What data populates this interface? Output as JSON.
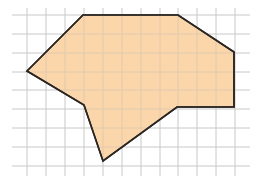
{
  "diagram": {
    "type": "polygon-on-grid",
    "grid": {
      "x_start": 12,
      "x_end": 250,
      "y_start": 8,
      "y_end": 176,
      "vertical_lines": [
        27,
        46,
        65,
        84,
        103,
        122,
        141,
        160,
        178,
        197,
        216,
        235
      ],
      "horizontal_lines": [
        15,
        34,
        53,
        72,
        90,
        109,
        128,
        147,
        166
      ],
      "line_color": "#c8c8c8"
    },
    "polygon": {
      "points": [
        [
          83,
          15
        ],
        [
          178,
          15
        ],
        [
          234,
          52
        ],
        [
          234,
          107
        ],
        [
          177,
          107
        ],
        [
          103,
          161
        ],
        [
          84,
          105
        ],
        [
          27,
          71
        ]
      ],
      "fill": "#f9cf9b",
      "stroke": "#2b2622",
      "stroke_width": 1.6
    }
  }
}
